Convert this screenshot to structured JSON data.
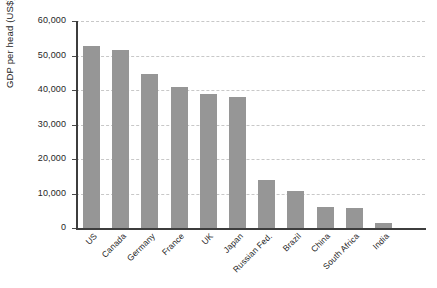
{
  "chart_data": {
    "type": "bar",
    "title": "",
    "subtitle": "",
    "xlabel": "",
    "ylabel": "GDP per head (US$)",
    "categories": [
      "US",
      "Canada",
      "Germany",
      "France",
      "UK",
      "Japan",
      "Russian Fed.",
      "Brazil",
      "China",
      "South Africa",
      "India"
    ],
    "values": [
      52800,
      51700,
      44500,
      41000,
      38800,
      38000,
      14000,
      10800,
      6100,
      5900,
      1500
    ],
    "series": [
      {
        "name": "GDP per head (US$)",
        "values": [
          52800,
          51700,
          44500,
          41000,
          38800,
          38000,
          14000,
          10800,
          6100,
          5900,
          1500
        ]
      }
    ],
    "ylim": [
      0,
      60000
    ],
    "ytick_values": [
      0,
      10000,
      20000,
      30000,
      40000,
      50000,
      60000
    ],
    "ytick_labels": [
      "0",
      "10,000",
      "20,000",
      "30,000",
      "40,000",
      "50,000",
      "60,000"
    ],
    "grid": true,
    "grid_axis": "y",
    "grid_style": "dashed",
    "legend": false,
    "legend_position": "none",
    "bar_color": "#969696",
    "grid_color": "#c8c8c8",
    "axis_color": "#3d3d3d",
    "background_color": "#ffffff",
    "annotations": []
  }
}
